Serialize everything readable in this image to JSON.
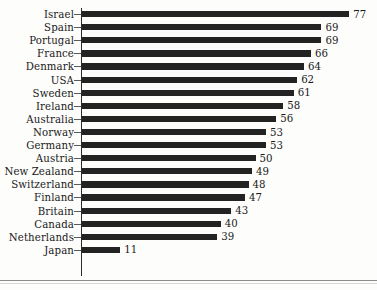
{
  "chart_data": {
    "type": "bar",
    "orientation": "horizontal",
    "title": "",
    "subtitle": "",
    "xlabel": "",
    "ylabel": "",
    "xlim": [
      0,
      80
    ],
    "grid": false,
    "legend": null,
    "categories": [
      "Israel",
      "Spain",
      "Portugal",
      "France",
      "Denmark",
      "USA",
      "Sweden",
      "Ireland",
      "Australia",
      "Norway",
      "Germany",
      "Austria",
      "New Zealand",
      "Switzerland",
      "Finland",
      "Britain",
      "Canada",
      "Netherlands",
      "Japan"
    ],
    "values": [
      77,
      69,
      69,
      66,
      64,
      62,
      61,
      58,
      56,
      53,
      53,
      50,
      49,
      48,
      47,
      43,
      40,
      39,
      11
    ],
    "value_labels": [
      "77",
      "69",
      "69",
      "66",
      "64",
      "62",
      "61",
      "58",
      "56",
      "53",
      "53",
      "50",
      "49",
      "48",
      "47",
      "43",
      "40",
      "39",
      "11"
    ],
    "bar_color": "#232323",
    "axis_color": "#2b2b2b",
    "rows": [
      {
        "label": "Israel",
        "value": 77,
        "value_label": "77"
      },
      {
        "label": "Spain",
        "value": 69,
        "value_label": "69"
      },
      {
        "label": "Portugal",
        "value": 69,
        "value_label": "69"
      },
      {
        "label": "France",
        "value": 66,
        "value_label": "66"
      },
      {
        "label": "Denmark",
        "value": 64,
        "value_label": "64"
      },
      {
        "label": "USA",
        "value": 62,
        "value_label": "62"
      },
      {
        "label": "Sweden",
        "value": 61,
        "value_label": "61"
      },
      {
        "label": "Ireland",
        "value": 58,
        "value_label": "58"
      },
      {
        "label": "Australia",
        "value": 56,
        "value_label": "56"
      },
      {
        "label": "Norway",
        "value": 53,
        "value_label": "53"
      },
      {
        "label": "Germany",
        "value": 53,
        "value_label": "53"
      },
      {
        "label": "Austria",
        "value": 50,
        "value_label": "50"
      },
      {
        "label": "New Zealand",
        "value": 49,
        "value_label": "49"
      },
      {
        "label": "Switzerland",
        "value": 48,
        "value_label": "48"
      },
      {
        "label": "Finland",
        "value": 47,
        "value_label": "47"
      },
      {
        "label": "Britain",
        "value": 43,
        "value_label": "43"
      },
      {
        "label": "Canada",
        "value": 40,
        "value_label": "40"
      },
      {
        "label": "Netherlands",
        "value": 39,
        "value_label": "39"
      },
      {
        "label": "Japan",
        "value": 11,
        "value_label": "11"
      }
    ]
  }
}
